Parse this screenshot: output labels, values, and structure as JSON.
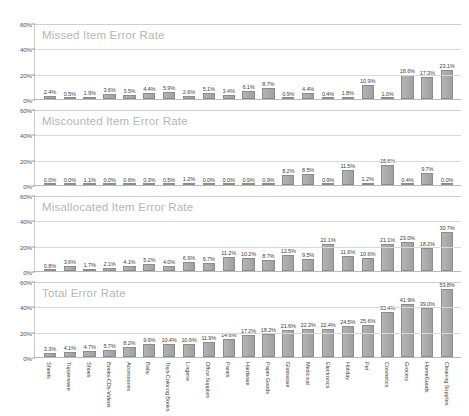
{
  "chart_data": [
    {
      "type": "bar",
      "title": "Missed Item Error Rate",
      "xlabel": "",
      "ylabel": "",
      "ylim": [
        0,
        60
      ],
      "yticks": [
        "0%",
        "20%",
        "40%",
        "60%"
      ],
      "grid": true,
      "legend": "none",
      "categories": [
        "Sheets",
        "Tupperware",
        "Shoes",
        "Books-CDs-Videos",
        "Accessories",
        "Baby",
        "Toys-Coloring Books",
        "Lingerie",
        "Office Supplies",
        "Panes",
        "Hardware",
        "Paper Goods",
        "Glassware",
        "Medicinal",
        "Electronics",
        "Holiday",
        "Pet",
        "Cosmetics",
        "Grocery",
        "HomeGoods",
        "Cleaning Supplies"
      ],
      "values": [
        2.4,
        0.5,
        1.9,
        3.6,
        3.5,
        4.4,
        5.9,
        2.6,
        5.1,
        3.4,
        6.1,
        8.7,
        0.9,
        4.4,
        0.4,
        1.8,
        10.9,
        1.0,
        18.6,
        17.3,
        23.1
      ],
      "labels": [
        "2.4%",
        "0.5%",
        "1.9%",
        "3.6%",
        "3.5%",
        "4.4%",
        "5.9%",
        "2.6%",
        "5.1%",
        "3.4%",
        "6.1%",
        "8.7%",
        "0.9%",
        "4.4%",
        "0.4%",
        "1.8%",
        "10.9%",
        "1.0%",
        "18.6%",
        "17.3%",
        "23.1%"
      ]
    },
    {
      "type": "bar",
      "title": "Miscounted Item Error Rate",
      "xlabel": "",
      "ylabel": "",
      "ylim": [
        0,
        60
      ],
      "yticks": [
        "0%",
        "20%",
        "40%",
        "60%"
      ],
      "grid": true,
      "legend": "none",
      "categories": [
        "Sheets",
        "Tupperware",
        "Shoes",
        "Books-CDs-Videos",
        "Accessories",
        "Baby",
        "Toys-Coloring Books",
        "Lingerie",
        "Office Supplies",
        "Panes",
        "Hardware",
        "Paper Goods",
        "Glassware",
        "Medicinal",
        "Electronics",
        "Holiday",
        "Pet",
        "Cosmetics",
        "Grocery",
        "HomeGoods",
        "Cleaning Supplies"
      ],
      "values": [
        0.0,
        0.0,
        1.1,
        0.0,
        0.6,
        0.3,
        0.5,
        1.2,
        0.0,
        0.0,
        0.9,
        0.9,
        8.2,
        8.5,
        0.9,
        11.5,
        1.2,
        15.6,
        0.4,
        9.7,
        0.0
      ],
      "labels": [
        "0.0%",
        "0.0%",
        "1.1%",
        "0.0%",
        "0.6%",
        "0.3%",
        "0.5%",
        "1.2%",
        "0.0%",
        "0.0%",
        "0.9%",
        "0.9%",
        "8.2%",
        "8.5%",
        "0.9%",
        "11.5%",
        "1.2%",
        "15.6%",
        "0.4%",
        "9.7%",
        "0.0%"
      ]
    },
    {
      "type": "bar",
      "title": "Misallocated Item Error Rate",
      "xlabel": "",
      "ylabel": "",
      "ylim": [
        0,
        60
      ],
      "yticks": [
        "0%",
        "20%",
        "40%",
        "60%"
      ],
      "grid": true,
      "legend": "none",
      "categories": [
        "Sheets",
        "Tupperware",
        "Shoes",
        "Books-CDs-Videos",
        "Accessories",
        "Baby",
        "Toys-Coloring Books",
        "Lingerie",
        "Office Supplies",
        "Panes",
        "Hardware",
        "Paper Goods",
        "Glassware",
        "Medicinal",
        "Electronics",
        "Holiday",
        "Pet",
        "Cosmetics",
        "Grocery",
        "HomeGoods",
        "Cleaning Supplies"
      ],
      "values": [
        0.8,
        3.6,
        1.7,
        2.1,
        4.1,
        5.2,
        4.0,
        6.9,
        6.7,
        11.2,
        10.2,
        8.7,
        12.5,
        9.5,
        21.1,
        11.6,
        10.6,
        21.1,
        23.0,
        18.2,
        30.7
      ],
      "labels": [
        "0.8%",
        "3.6%",
        "1.7%",
        "2.1%",
        "4.1%",
        "5.2%",
        "4.0%",
        "6.9%",
        "6.7%",
        "11.2%",
        "10.2%",
        "8.7%",
        "12.5%",
        "9.5%",
        "21.1%",
        "11.6%",
        "10.6%",
        "21.1%",
        "23.0%",
        "18.2%",
        "30.7%"
      ]
    },
    {
      "type": "bar",
      "title": "Total Error Rate",
      "xlabel": "",
      "ylabel": "",
      "ylim": [
        0,
        60
      ],
      "yticks": [
        "0%",
        "20%",
        "40%",
        "60%"
      ],
      "grid": true,
      "legend": "none",
      "categories": [
        "Sheets",
        "Tupperware",
        "Shoes",
        "Books-CDs-Videos",
        "Accessories",
        "Baby",
        "Toys-Coloring Books",
        "Lingerie",
        "Office Supplies",
        "Panes",
        "Hardware",
        "Paper Goods",
        "Glassware",
        "Medicinal",
        "Electronics",
        "Holiday",
        "Pet",
        "Cosmetics",
        "Grocery",
        "HomeGoods",
        "Cleaning Supplies"
      ],
      "values": [
        3.3,
        4.1,
        4.7,
        5.7,
        8.2,
        9.9,
        10.4,
        10.6,
        11.9,
        14.6,
        17.2,
        18.2,
        21.6,
        22.3,
        22.4,
        24.5,
        25.6,
        35.4,
        41.9,
        39.0,
        53.8
      ],
      "labels": [
        "3.3%",
        "4.1%",
        "4.7%",
        "5.7%",
        "8.2%",
        "9.9%",
        "10.4%",
        "10.6%",
        "11.9%",
        "14.6%",
        "17.2%",
        "18.2%",
        "21.6%",
        "22.3%",
        "22.4%",
        "24.5%",
        "25.6%",
        "35.4%",
        "41.9%",
        "39.0%",
        "53.8%"
      ]
    }
  ],
  "colors": {
    "bar_fill": "#a8a8a8",
    "bar_stroke": "#8c8c8c",
    "grid": "#d8d8d8",
    "title_text": "#b6b6b6",
    "label_text": "#444444",
    "background": "#ffffff"
  }
}
